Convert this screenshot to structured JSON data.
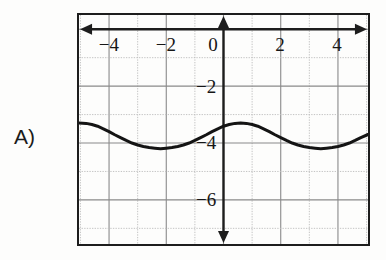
{
  "problem": {
    "label": "A)"
  },
  "chart_data": {
    "type": "line",
    "title": "",
    "xlabel": "",
    "ylabel": "",
    "xlim": [
      -5.05,
      5.05
    ],
    "ylim": [
      -7.55,
      0.5
    ],
    "grid": true,
    "grid_major_step": 1,
    "legend": null,
    "axis_color": "#1d1d1d",
    "curve_color": "#141414",
    "grid_major_color": "#8a8a8a",
    "grid_minor_color": "#bdbdbd",
    "background_color": "#fdfdfc",
    "x_ticks": [
      -4,
      -2,
      0,
      2,
      4
    ],
    "x_tick_labels": [
      "−4",
      "−2",
      "0",
      "2",
      "4"
    ],
    "y_ticks": [
      -2,
      -4,
      -6
    ],
    "y_tick_labels": [
      "−2",
      "−4",
      "−6"
    ],
    "function": "y = -4 + 0.7*cos(pi*x/2)",
    "amplitude": 0.7,
    "midline": -4,
    "period": 4,
    "phase": 0,
    "x": [
      -5.05,
      -4.8,
      -4.6,
      -4.4,
      -4.2,
      -4.0,
      -3.8,
      -3.6,
      -3.4,
      -3.2,
      -3.0,
      -2.8,
      -2.6,
      -2.4,
      -2.2,
      -2.0,
      -1.8,
      -1.6,
      -1.4,
      -1.2,
      -1.0,
      -0.8,
      -0.6,
      -0.4,
      -0.2,
      0.0,
      0.2,
      0.4,
      0.6,
      0.8,
      1.0,
      1.2,
      1.4,
      1.6,
      1.8,
      2.0,
      2.2,
      2.4,
      2.6,
      2.8,
      3.0,
      3.2,
      3.4,
      3.6,
      3.8,
      4.0,
      4.2,
      4.4,
      4.6,
      4.8,
      5.05
    ],
    "y": [
      -3.3,
      -3.31,
      -3.35,
      -3.41,
      -3.5,
      -3.6,
      -3.71,
      -3.81,
      -3.91,
      -4.0,
      -4.07,
      -4.12,
      -4.16,
      -4.18,
      -4.2,
      -4.18,
      -4.16,
      -4.12,
      -4.07,
      -4.0,
      -3.91,
      -3.81,
      -3.71,
      -3.6,
      -3.5,
      -3.41,
      -3.35,
      -3.31,
      -3.3,
      -3.31,
      -3.35,
      -3.41,
      -3.5,
      -3.6,
      -3.71,
      -3.81,
      -3.91,
      -4.0,
      -4.07,
      -4.12,
      -4.16,
      -4.18,
      -4.2,
      -4.18,
      -4.16,
      -4.12,
      -4.07,
      -4.0,
      -3.91,
      -3.81,
      -3.7
    ],
    "annotations": []
  }
}
